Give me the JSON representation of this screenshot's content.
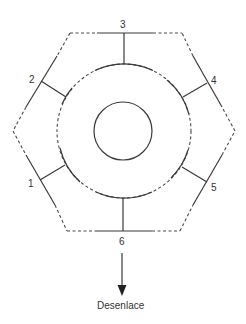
{
  "diagram": {
    "type": "cycle-hexagon",
    "nodes": [
      {
        "id": "1",
        "label": "1"
      },
      {
        "id": "2",
        "label": "2"
      },
      {
        "id": "3",
        "label": "3"
      },
      {
        "id": "4",
        "label": "4"
      },
      {
        "id": "5",
        "label": "5"
      },
      {
        "id": "6",
        "label": "6"
      }
    ],
    "outcome": {
      "from": "6",
      "label": "Desenlace"
    },
    "colors": {
      "stroke": "#3a3a3a",
      "text": "#333333",
      "background": "#ffffff"
    }
  }
}
